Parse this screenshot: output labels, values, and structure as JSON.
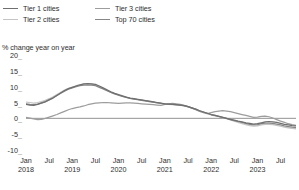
{
  "legend": {
    "items": [
      {
        "label": "Tier 1 cities",
        "color": "#6f6f6f",
        "icon": "line-swatch-icon"
      },
      {
        "label": "Tier 3 cities",
        "color": "#9d9d9d",
        "icon": "line-swatch-icon"
      },
      {
        "label": "Tier 2 cities",
        "color": "#c4c4c4",
        "icon": "line-swatch-icon"
      },
      {
        "label": "Top 70 cities",
        "color": "#868686",
        "icon": "line-swatch-icon"
      }
    ]
  },
  "axis": {
    "y_title": "% change year on year",
    "y_ticks": [
      "20",
      "15",
      "10",
      "5",
      "0",
      "-5",
      "-10"
    ],
    "tick_dash": "_",
    "x_labels": [
      {
        "month": "Jan",
        "year": "2018"
      },
      {
        "month": "Jul",
        "year": ""
      },
      {
        "month": "Jan",
        "year": "2019"
      },
      {
        "month": "Jul",
        "year": ""
      },
      {
        "month": "Jan",
        "year": "2020"
      },
      {
        "month": "Jul",
        "year": ""
      },
      {
        "month": "Jan",
        "year": "2021"
      },
      {
        "month": "Jul",
        "year": ""
      },
      {
        "month": "Jan",
        "year": "2022"
      },
      {
        "month": "Jul",
        "year": ""
      },
      {
        "month": "Jan",
        "year": "2023"
      },
      {
        "month": "Jul",
        "year": ""
      }
    ]
  },
  "chart_data": {
    "type": "line",
    "title": "",
    "subtitle": "",
    "xlabel": "",
    "ylabel": "% change year on year",
    "ylim": [
      -10,
      20
    ],
    "ytick_values": [
      20,
      15,
      10,
      5,
      0,
      -5,
      -10
    ],
    "grid": false,
    "zero_line": true,
    "legend_position": "top-left",
    "x_unit": "month",
    "x_start": "2018-01",
    "x_end": "2023-11",
    "x_tick_labels": [
      "Jan 2018",
      "Jul",
      "Jan 2019",
      "Jul",
      "Jan 2020",
      "Jul",
      "Jan 2021",
      "Jul",
      "Jan 2022",
      "Jul",
      "Jan 2023",
      "Jul"
    ],
    "x": [
      "2018-01",
      "2018-02",
      "2018-03",
      "2018-04",
      "2018-05",
      "2018-06",
      "2018-07",
      "2018-08",
      "2018-09",
      "2018-10",
      "2018-11",
      "2018-12",
      "2019-01",
      "2019-02",
      "2019-03",
      "2019-04",
      "2019-05",
      "2019-06",
      "2019-07",
      "2019-08",
      "2019-09",
      "2019-10",
      "2019-11",
      "2019-12",
      "2020-01",
      "2020-02",
      "2020-03",
      "2020-04",
      "2020-05",
      "2020-06",
      "2020-07",
      "2020-08",
      "2020-09",
      "2020-10",
      "2020-11",
      "2020-12",
      "2021-01",
      "2021-02",
      "2021-03",
      "2021-04",
      "2021-05",
      "2021-06",
      "2021-07",
      "2021-08",
      "2021-09",
      "2021-10",
      "2021-11",
      "2021-12",
      "2022-01",
      "2022-02",
      "2022-03",
      "2022-04",
      "2022-05",
      "2022-06",
      "2022-07",
      "2022-08",
      "2022-09",
      "2022-10",
      "2022-11",
      "2022-12",
      "2023-01",
      "2023-02",
      "2023-03",
      "2023-04",
      "2023-05",
      "2023-06",
      "2023-07",
      "2023-08",
      "2023-09",
      "2023-10",
      "2023-11"
    ],
    "series": [
      {
        "name": "Tier 1 cities",
        "color": "#6f6f6f",
        "values": [
          4.4,
          4.2,
          4.1,
          4.4,
          4.8,
          5.2,
          5.8,
          6.4,
          7.2,
          8.0,
          8.8,
          9.4,
          9.8,
          10.2,
          10.6,
          10.9,
          11.0,
          10.9,
          10.7,
          10.2,
          9.6,
          9.0,
          8.4,
          7.9,
          7.5,
          7.1,
          6.7,
          6.4,
          6.2,
          6.0,
          5.8,
          5.6,
          5.4,
          5.2,
          5.0,
          4.8,
          4.6,
          4.5,
          4.4,
          4.3,
          4.2,
          4.0,
          3.7,
          3.3,
          2.9,
          2.4,
          2.0,
          1.6,
          1.2,
          0.9,
          0.6,
          0.3,
          0.0,
          -0.3,
          -0.6,
          -0.9,
          -1.1,
          -1.4,
          -1.6,
          -1.8,
          -1.7,
          -1.4,
          -1.1,
          -1.0,
          -1.1,
          -1.3,
          -1.6,
          -1.9,
          -2.1,
          -2.3,
          -2.4
        ]
      },
      {
        "name": "Tier 2 cities",
        "color": "#c4c4c4",
        "values": [
          5.1,
          5.0,
          4.8,
          5.0,
          5.3,
          5.7,
          6.2,
          6.8,
          7.5,
          8.2,
          8.9,
          9.5,
          9.9,
          10.3,
          10.6,
          10.8,
          10.9,
          10.8,
          10.5,
          10.0,
          9.4,
          8.8,
          8.2,
          7.7,
          7.3,
          6.9,
          6.6,
          6.3,
          6.1,
          5.9,
          5.7,
          5.5,
          5.3,
          5.1,
          4.9,
          4.7,
          4.5,
          4.4,
          4.3,
          4.2,
          4.1,
          3.9,
          3.6,
          3.2,
          2.8,
          2.3,
          1.9,
          1.5,
          1.1,
          0.8,
          0.5,
          0.2,
          -0.1,
          -0.5,
          -0.9,
          -1.3,
          -1.7,
          -2.0,
          -2.3,
          -2.5,
          -2.4,
          -2.1,
          -1.9,
          -1.9,
          -2.0,
          -2.2,
          -2.5,
          -2.8,
          -3.0,
          -3.2,
          -3.3
        ]
      },
      {
        "name": "Tier 3 cities",
        "color": "#9d9d9d",
        "values": [
          0.3,
          0.1,
          -0.2,
          -0.4,
          -0.3,
          0.0,
          0.4,
          0.8,
          1.2,
          1.7,
          2.2,
          2.7,
          3.1,
          3.4,
          3.6,
          3.9,
          4.3,
          4.6,
          4.8,
          4.9,
          5.0,
          5.0,
          4.9,
          4.8,
          4.7,
          4.8,
          4.9,
          4.9,
          4.8,
          4.7,
          4.6,
          4.5,
          4.4,
          4.3,
          4.2,
          4.1,
          4.4,
          4.6,
          4.7,
          4.6,
          4.4,
          4.1,
          3.7,
          3.2,
          2.7,
          2.2,
          1.8,
          1.5,
          1.8,
          2.1,
          2.3,
          2.4,
          2.3,
          2.1,
          1.8,
          1.5,
          1.2,
          0.9,
          0.6,
          0.3,
          0.4,
          0.6,
          0.7,
          0.5,
          0.1,
          -0.4,
          -0.9,
          -1.3,
          -1.7,
          -2.0,
          -2.2
        ]
      },
      {
        "name": "Top 70 cities",
        "color": "#868686",
        "values": [
          4.6,
          4.4,
          4.3,
          4.5,
          4.9,
          5.3,
          5.9,
          6.5,
          7.2,
          7.9,
          8.6,
          9.2,
          9.6,
          10.0,
          10.3,
          10.5,
          10.6,
          10.5,
          10.3,
          9.8,
          9.3,
          8.7,
          8.2,
          7.7,
          7.3,
          6.9,
          6.6,
          6.3,
          6.1,
          5.9,
          5.7,
          5.5,
          5.3,
          5.1,
          4.9,
          4.7,
          4.6,
          4.5,
          4.4,
          4.3,
          4.2,
          4.0,
          3.7,
          3.3,
          2.9,
          2.4,
          2.0,
          1.6,
          1.2,
          0.9,
          0.6,
          0.3,
          0.0,
          -0.4,
          -0.7,
          -1.0,
          -1.3,
          -1.6,
          -1.9,
          -2.1,
          -2.0,
          -1.7,
          -1.5,
          -1.5,
          -1.6,
          -1.8,
          -2.1,
          -2.4,
          -2.6,
          -2.8,
          -2.9
        ]
      }
    ]
  }
}
